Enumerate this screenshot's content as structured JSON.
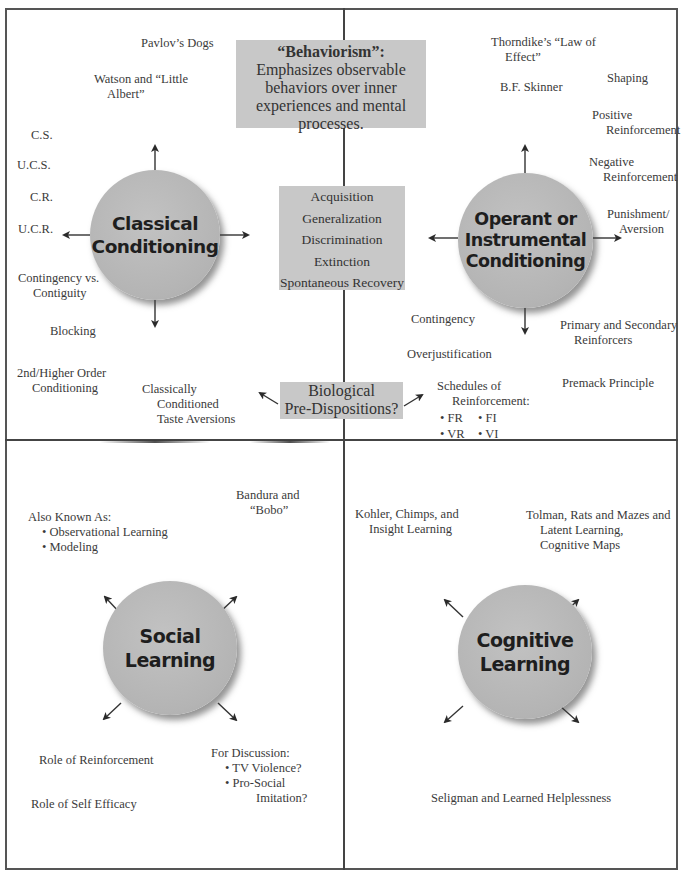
{
  "diagram": {
    "type": "concept-map",
    "quadrants": [
      "Classical Conditioning",
      "Operant or Instrumental Conditioning",
      "Social Learning",
      "Cognitive Learning"
    ]
  },
  "center": {
    "behaviorism": {
      "title": "“Behaviorism”:",
      "body_lines": [
        "Emphasizes observable",
        "behaviors over inner",
        "experiences and mental",
        "processes."
      ]
    },
    "shared_terms": [
      "Acquisition",
      "Generalization",
      "Discrimination",
      "Extinction",
      "Spontaneous Recovery"
    ],
    "biological": [
      "Biological",
      "Pre-Dispositions?"
    ]
  },
  "classical": {
    "title_lines": [
      "Classical",
      "Conditioning"
    ],
    "labels": [
      {
        "lines": [
          "Pavlov’s Dogs"
        ]
      },
      {
        "lines": [
          "Watson and “Little",
          "Albert”"
        ]
      },
      {
        "lines": [
          "C.S."
        ]
      },
      {
        "lines": [
          "U.C.S."
        ]
      },
      {
        "lines": [
          "C.R."
        ]
      },
      {
        "lines": [
          "U.C.R."
        ]
      },
      {
        "lines": [
          "Contingency vs.",
          "Contiguity"
        ]
      },
      {
        "lines": [
          "Blocking"
        ]
      },
      {
        "lines": [
          "2nd/Higher Order",
          "Conditioning"
        ]
      },
      {
        "lines": [
          "Classically",
          "Conditioned",
          "Taste Aversions"
        ]
      }
    ]
  },
  "operant": {
    "title_lines": [
      "Operant or",
      "Instrumental",
      "Conditioning"
    ],
    "labels": [
      {
        "lines": [
          "Thorndike’s “Law of",
          "Effect”"
        ]
      },
      {
        "lines": [
          "B.F. Skinner"
        ]
      },
      {
        "lines": [
          "Shaping"
        ]
      },
      {
        "lines": [
          "Positive",
          "Reinforcement"
        ]
      },
      {
        "lines": [
          "Negative",
          "Reinforcement"
        ]
      },
      {
        "lines": [
          "Punishment/",
          "Aversion"
        ]
      },
      {
        "lines": [
          "Contingency"
        ]
      },
      {
        "lines": [
          "Primary and Secondary",
          "Reinforcers"
        ]
      },
      {
        "lines": [
          "Overjustification"
        ]
      },
      {
        "lines": [
          "Schedules of",
          "Reinforcement:"
        ]
      },
      {
        "lines": [
          "Premack Principle"
        ]
      }
    ],
    "schedules": [
      "• FR",
      "• FI",
      "• VR",
      "• VI"
    ]
  },
  "social": {
    "title_lines": [
      "Social",
      "Learning"
    ],
    "labels": [
      {
        "lines": [
          "Bandura and",
          "“Bobo”"
        ]
      },
      {
        "lines": [
          "Also Known As:",
          "• Observational Learning",
          "• Modeling"
        ]
      },
      {
        "lines": [
          "Role of Reinforcement"
        ]
      },
      {
        "lines": [
          "For Discussion:",
          "• TV Violence?",
          "• Pro-Social",
          "Imitation?"
        ]
      },
      {
        "lines": [
          "Role of Self Efficacy"
        ]
      }
    ]
  },
  "cognitive": {
    "title_lines": [
      "Cognitive",
      "Learning"
    ],
    "labels": [
      {
        "lines": [
          "Kohler, Chimps, and",
          "Insight Learning"
        ]
      },
      {
        "lines": [
          "Tolman, Rats and Mazes and",
          "Latent Learning,",
          "Cognitive Maps"
        ]
      },
      {
        "lines": [
          "Seligman and Learned Helplessness"
        ]
      }
    ]
  },
  "colors": {
    "box_fill": "#c8c8c8",
    "circle_fill": "#b8b8b8",
    "bullet_dot": "#c4c4c4",
    "lines": "#444444",
    "text": "#333333"
  }
}
